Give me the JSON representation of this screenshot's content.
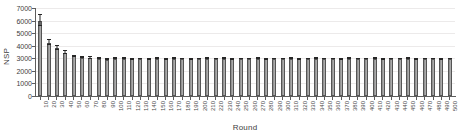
{
  "chart_data": {
    "type": "bar",
    "title": "",
    "xlabel": "Round",
    "ylabel": "NSP",
    "ylim": [
      0,
      7000
    ],
    "ytick_values": [
      0,
      1000,
      2000,
      3000,
      4000,
      5000,
      6000,
      7000
    ],
    "ytick_labels": [
      "0",
      "1000",
      "2000",
      "3000",
      "4000",
      "5000",
      "6000",
      "7000"
    ],
    "grid": true,
    "grid_axis": "y",
    "legend": "none",
    "bar_color": "#a0a0a0",
    "error_bar_color": "#262626",
    "has_error_bars": true,
    "categories": [
      "10",
      "20",
      "30",
      "40",
      "50",
      "60",
      "70",
      "80",
      "90",
      "100",
      "110",
      "120",
      "130",
      "140",
      "150",
      "160",
      "170",
      "180",
      "190",
      "200",
      "210",
      "220",
      "230",
      "240",
      "250",
      "260",
      "270",
      "280",
      "290",
      "300",
      "310",
      "320",
      "330",
      "340",
      "350",
      "360",
      "370",
      "380",
      "390",
      "400",
      "410",
      "420",
      "430",
      "440",
      "450",
      "460",
      "470",
      "480",
      "490",
      "500"
    ],
    "values": [
      6000,
      4250,
      3800,
      3450,
      3150,
      3050,
      3020,
      2980,
      2900,
      2950,
      2960,
      2930,
      2940,
      2920,
      2950,
      2930,
      2960,
      2940,
      2930,
      2950,
      2970,
      2940,
      2960,
      2930,
      2950,
      2940,
      2960,
      2930,
      2950,
      2940,
      2960,
      2930,
      2950,
      2970,
      2940,
      2950,
      2930,
      2960,
      2940,
      2950,
      2960,
      2930,
      2950,
      2940,
      2960,
      2930,
      2950,
      2940,
      2930,
      2950
    ],
    "errors": [
      420,
      180,
      140,
      95,
      70,
      50,
      45,
      40,
      38,
      40,
      38,
      36,
      35,
      34,
      35,
      34,
      35,
      34,
      33,
      34,
      34,
      33,
      34,
      33,
      34,
      33,
      34,
      33,
      34,
      33,
      34,
      33,
      34,
      34,
      33,
      34,
      33,
      34,
      33,
      34,
      34,
      33,
      34,
      33,
      34,
      33,
      34,
      33,
      33,
      34
    ]
  }
}
